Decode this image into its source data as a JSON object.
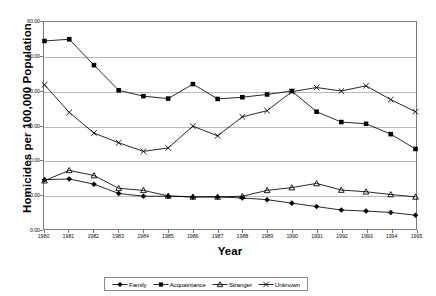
{
  "chart_data": {
    "type": "line",
    "title": "",
    "xlabel": "Year",
    "ylabel": "Homicides per 100,000 Population",
    "categories": [
      "1980",
      "1981",
      "1982",
      "1983",
      "1984",
      "1985",
      "1986",
      "1987",
      "1988",
      "1989",
      "1990",
      "1991",
      "1992",
      "1993",
      "1994",
      "1995"
    ],
    "x": [
      1980,
      1981,
      1982,
      1983,
      1984,
      1985,
      1986,
      1987,
      1988,
      1989,
      1990,
      1991,
      1992,
      1993,
      1994,
      1995
    ],
    "ylim": [
      0,
      60
    ],
    "yticks": [
      "0.00",
      "10.00",
      "20.00",
      "30.00",
      "40.00",
      "50.00",
      "60.00"
    ],
    "ytick_values": [
      0,
      10,
      20,
      30,
      40,
      50,
      60
    ],
    "grid": true,
    "legend_position": "bottom",
    "series": [
      {
        "name": "Family",
        "marker": "diamond",
        "color": "#000000",
        "values": [
          14.3,
          14.5,
          13.0,
          10.3,
          9.5,
          9.5,
          9.3,
          9.3,
          9.0,
          8.5,
          7.5,
          6.5,
          5.5,
          5.2,
          4.8,
          4.0
        ]
      },
      {
        "name": "Acquaintance",
        "marker": "square",
        "color": "#000000",
        "values": [
          54.5,
          55.0,
          47.5,
          40.2,
          38.5,
          37.8,
          42.0,
          37.7,
          38.2,
          39.0,
          40.0,
          34.0,
          31.0,
          30.5,
          27.5,
          23.2
        ]
      },
      {
        "name": "Stranger",
        "marker": "triangle",
        "color": "#000000",
        "values": [
          14.0,
          17.0,
          15.5,
          11.8,
          11.2,
          9.6,
          9.3,
          9.3,
          9.5,
          11.2,
          12.0,
          13.2,
          11.3,
          10.8,
          10.0,
          9.3
        ]
      },
      {
        "name": "Unknown",
        "marker": "cross",
        "color": "#000000",
        "values": [
          41.8,
          33.8,
          27.8,
          25.0,
          22.5,
          23.5,
          29.8,
          27.0,
          32.5,
          34.3,
          39.8,
          41.0,
          40.0,
          41.5,
          37.5,
          34.0
        ]
      }
    ]
  },
  "axis": {
    "y_title": "Homicides per 100,000 Population",
    "x_title": "Year"
  },
  "legend": {
    "items": [
      {
        "label": "Family",
        "marker": "diamond"
      },
      {
        "label": "Acquaintance",
        "marker": "square"
      },
      {
        "label": "Stranger",
        "marker": "triangle"
      },
      {
        "label": "Unknown",
        "marker": "cross"
      }
    ]
  },
  "colors": {
    "line": "#000000",
    "grid": "#b9b9b9",
    "frame": "#7a7a7a",
    "background": "#ffffff"
  }
}
